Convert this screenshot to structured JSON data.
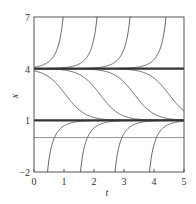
{
  "chart_data": {
    "type": "line",
    "title": "",
    "xlabel": "t",
    "ylabel": "x",
    "xlim": [
      0,
      5
    ],
    "ylim": [
      -2,
      7
    ],
    "xticks": [
      "0",
      "1",
      "2",
      "3",
      "4",
      "5"
    ],
    "yticks": [
      "7",
      "4",
      "1",
      "−2"
    ],
    "ytick_values": [
      7,
      4,
      1,
      -2
    ],
    "grid": false,
    "legend": null,
    "equilibria": [
      {
        "x": 4,
        "style": "thick"
      },
      {
        "x": 1,
        "style": "thick"
      },
      {
        "x": 0,
        "style": "thin"
      }
    ],
    "series": [
      {
        "name": "above-4 #1",
        "kind": "blowup",
        "reaches_top_at_t": 0.97
      },
      {
        "name": "above-4 #2",
        "kind": "blowup",
        "reaches_top_at_t": 2.1
      },
      {
        "name": "above-4 #3",
        "kind": "blowup",
        "reaches_top_at_t": 3.2
      },
      {
        "name": "above-4 #4",
        "kind": "blowup",
        "reaches_top_at_t": 4.4
      },
      {
        "name": "between #1",
        "kind": "decay",
        "midpoint_t": 1.05
      },
      {
        "name": "between #2",
        "kind": "decay",
        "midpoint_t": 2.2
      },
      {
        "name": "between #3",
        "kind": "decay",
        "midpoint_t": 3.35
      },
      {
        "name": "between #4",
        "kind": "decay",
        "midpoint_t": 4.5
      },
      {
        "name": "below-1 #1",
        "kind": "rise",
        "start_t_at_minus2": 0.45
      },
      {
        "name": "below-1 #2",
        "kind": "rise",
        "start_t_at_minus2": 1.55
      },
      {
        "name": "below-1 #3",
        "kind": "rise",
        "start_t_at_minus2": 2.7
      },
      {
        "name": "below-1 #4",
        "kind": "rise",
        "start_t_at_minus2": 3.85
      }
    ],
    "rate": 3,
    "colors": {
      "curve": "#555555",
      "equilibrium": "#333333",
      "frame": "#555555"
    }
  }
}
